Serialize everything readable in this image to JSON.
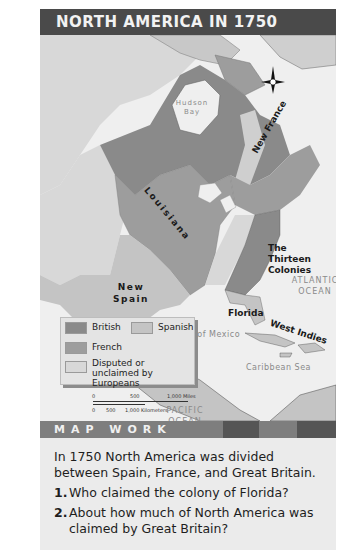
{
  "title": "NORTH AMERICA IN 1750",
  "map": {
    "water_labels": {
      "hudson_bay": "Hudson Bay",
      "great_lakes": "Great Lakes",
      "mississippi_river": "Mississippi River",
      "ohio_river": "Ohio River",
      "rio_grande": "Rio Grande",
      "atlantic_ocean": "ATLANTIC OCEAN",
      "gulf_of_mexico": "Gulf of Mexico",
      "caribbean_sea": "Caribbean Sea",
      "pacific_ocean": "PACIFIC OCEAN"
    },
    "region_labels": {
      "new_france": "New France",
      "louisiana": "Louisiana",
      "thirteen_colonies": "The Thirteen Colonies",
      "new_spain": "New Spain",
      "florida": "Florida",
      "west_indies": "West Indies"
    },
    "compass": {
      "north": "N",
      "east": "E",
      "south": "S",
      "west": "W"
    },
    "colors": {
      "british": "#8a8a8a",
      "french": "#9d9d9d",
      "spanish": "#c4c4c4",
      "disputed": "#d8d8d8",
      "water": "#efefef"
    }
  },
  "legend": {
    "items": [
      {
        "label": "British",
        "color": "#8a8a8a"
      },
      {
        "label": "Spanish",
        "color": "#c4c4c4"
      },
      {
        "label": "French",
        "color": "#9d9d9d"
      },
      {
        "label": "Disputed or unclaimed by Europeans",
        "color": "#d8d8d8"
      }
    ]
  },
  "scale": {
    "miles": [
      "0",
      "500",
      "1,000 Miles"
    ],
    "kilometers": [
      "0",
      "500",
      "1,000 Kilometers"
    ]
  },
  "map_work": {
    "heading": "MAP WORK",
    "intro": "In 1750 North America was divided between Spain, France, and Great Britain.",
    "questions": [
      {
        "number": "1.",
        "text": "Who claimed the colony of Florida?"
      },
      {
        "number": "2.",
        "text": "About how much of North America was claimed by Great Britain?"
      }
    ]
  }
}
